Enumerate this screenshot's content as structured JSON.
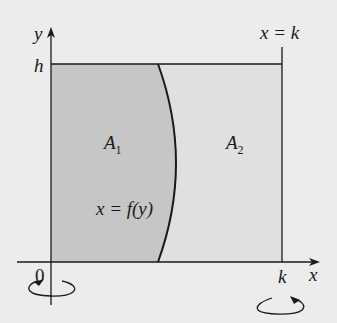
{
  "diagram": {
    "colors": {
      "background": "#ececec",
      "region_a1": "#c6c6c6",
      "region_a2": "#e0e0e0",
      "stroke": "#1a1a1a"
    },
    "labels": {
      "y_axis": "y",
      "x_axis": "x",
      "h": "h",
      "origin": "0",
      "k": "k",
      "line_label": "x = k",
      "region1": "A",
      "region1_sub": "1",
      "region2": "A",
      "region2_sub": "2",
      "curve_label": "x = f(y)"
    },
    "icons": {
      "left_rotation": "rotation-arrow-about-y-axis",
      "right_rotation": "rotation-arrow-about-x-equals-k"
    }
  }
}
